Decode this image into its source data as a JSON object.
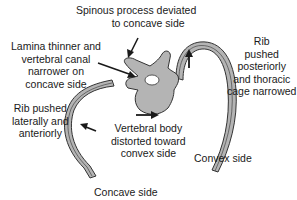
{
  "diagram": {
    "colors": {
      "bone_fill": "#b4b4b4",
      "outline": "#333333",
      "text": "#1a1a1a",
      "background": "#ffffff"
    },
    "labels": {
      "spinous_process": [
        "Spinous process deviated",
        "to concave side"
      ],
      "lamina": [
        "Lamina thinner and",
        "vertebral canal",
        "narrower on",
        "concave side"
      ],
      "rib_posterior": [
        "Rib",
        "pushed",
        "posteriorly",
        "and thoracic",
        "cage narrowed"
      ],
      "rib_lateral": [
        "Rib pushed",
        "laterally and",
        "anteriorly"
      ],
      "vertebral_body": [
        "Vertebral body",
        "distorted toward",
        "convex side"
      ],
      "convex_side": "Convex side",
      "concave_side": "Concave side"
    },
    "arrows": [
      {
        "name": "spinous-process-arrow",
        "direction": "down-left"
      },
      {
        "name": "lamina-arrow",
        "direction": "right-down"
      },
      {
        "name": "rib-posterior-arrow",
        "direction": "up"
      },
      {
        "name": "rib-lateral-arrow",
        "direction": "left"
      },
      {
        "name": "vertebral-body-arrow",
        "direction": "right"
      }
    ]
  }
}
